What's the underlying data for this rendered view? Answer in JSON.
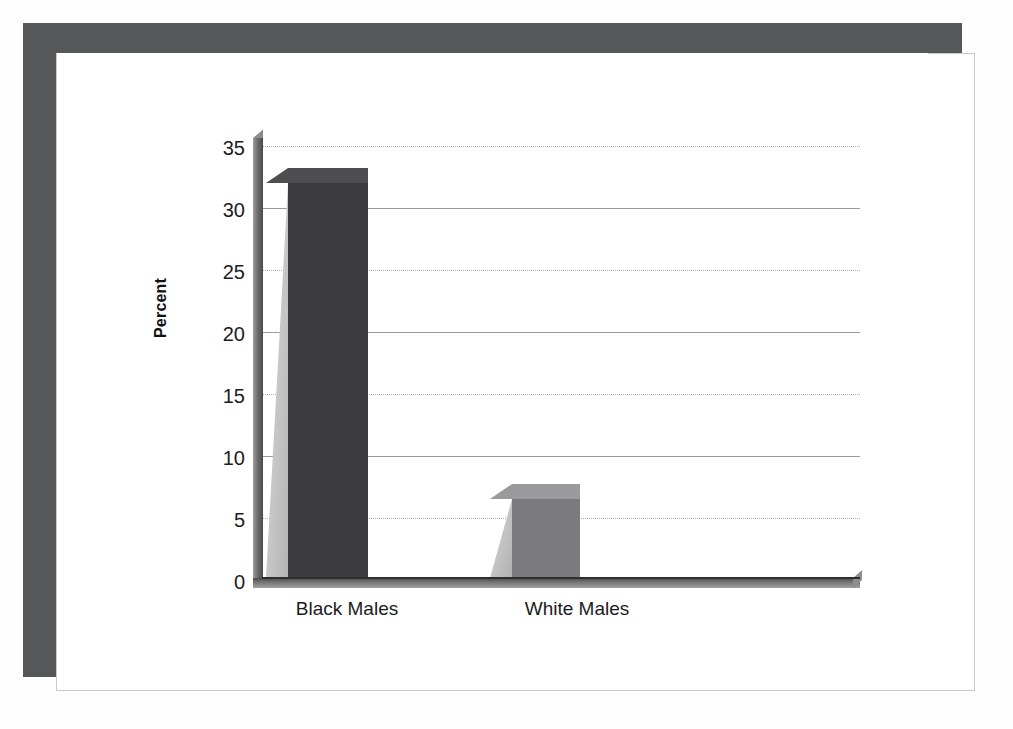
{
  "figure": {
    "frame_color": "#555759",
    "background_color": "#ffffff"
  },
  "chart_data": {
    "type": "bar",
    "title": "",
    "subtitle": "",
    "xlabel": "",
    "ylabel": "Percent",
    "categories": [
      "Black Males",
      "White Males"
    ],
    "values": [
      32,
      6.4
    ],
    "series": [
      {
        "name": "Percent",
        "values": [
          32,
          6.4
        ],
        "colors": [
          "#3b3b3d",
          "#7b7b7d"
        ]
      }
    ],
    "ylim": [
      0,
      35
    ],
    "yticks": [
      0,
      5,
      10,
      15,
      20,
      25,
      30,
      35
    ],
    "ytick_labels": [
      "0",
      "5",
      "10",
      "15",
      "20",
      "25",
      "30",
      "35"
    ],
    "xtick_labels": [
      "Black Males",
      "White Males"
    ],
    "grid": true,
    "grid_style": "alternating solid and dotted horizontal gridlines",
    "legend": "none",
    "style": "3D extruded bars with light gray left side faces, gray floor and left wall"
  },
  "axes": {
    "y_title": "Percent",
    "ticks": [
      {
        "label": "35",
        "value": 35,
        "style": "dotted"
      },
      {
        "label": "30",
        "value": 30,
        "style": "solid"
      },
      {
        "label": "25",
        "value": 25,
        "style": "dotted"
      },
      {
        "label": "20",
        "value": 20,
        "style": "solid"
      },
      {
        "label": "15",
        "value": 15,
        "style": "dotted"
      },
      {
        "label": "10",
        "value": 10,
        "style": "solid"
      },
      {
        "label": "5",
        "value": 5,
        "style": "dotted"
      },
      {
        "label": "0",
        "value": 0,
        "style": "baseline"
      }
    ]
  },
  "bars": [
    {
      "label": "Black Males",
      "value": 32,
      "color": "#3b3b3d"
    },
    {
      "label": "White Males",
      "value": 6.4,
      "color": "#7b7b7d"
    }
  ]
}
